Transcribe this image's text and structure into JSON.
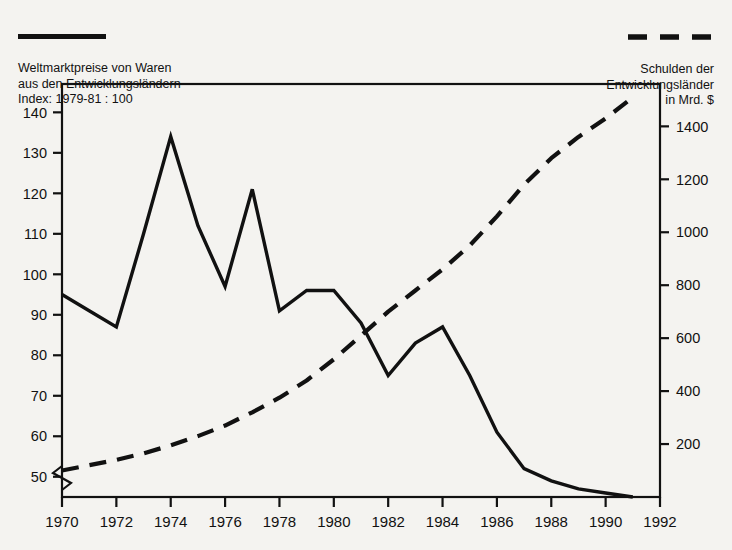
{
  "legend": {
    "left": {
      "swatch": "solid-line-swatch",
      "lines": [
        "Weltmarktpreise von Waren",
        "aus den Entwicklungsländern",
        "Index: 1979-81 : 100"
      ],
      "text": "Weltmarktpreise von Waren\naus den Entwicklungsländern\nIndex: 1979-81 : 100"
    },
    "right": {
      "swatch": "dashed-line-swatch",
      "lines": [
        "Schulden der",
        "Entwicklungsländer",
        "in Mrd. $"
      ],
      "text": "Schulden der\nEntwicklungsländer\nin Mrd. $"
    }
  },
  "colors": {
    "ink": "#111111",
    "background": "#f4f3f0"
  },
  "chart_data": {
    "type": "line",
    "title": "",
    "xlabel": "",
    "ylabel": "",
    "grid": false,
    "legend_position": "top",
    "x": [
      1970,
      1971,
      1972,
      1973,
      1974,
      1975,
      1976,
      1977,
      1978,
      1979,
      1980,
      1981,
      1982,
      1983,
      1984,
      1985,
      1986,
      1987,
      1988,
      1989,
      1990,
      1991
    ],
    "x_ticks": [
      1970,
      1972,
      1974,
      1976,
      1978,
      1980,
      1982,
      1984,
      1986,
      1988,
      1990,
      1992
    ],
    "xlim": [
      1970,
      1992
    ],
    "axis_break_left": true,
    "series": [
      {
        "name": "Weltmarktpreise von Waren aus den Entwicklungsländern",
        "unit": "Index: 1979-81 : 100",
        "axis": "left",
        "style": "solid",
        "color": "#111111",
        "values": [
          95,
          91,
          87,
          110,
          134,
          112,
          97,
          121,
          91,
          96,
          96,
          88,
          75,
          83,
          87,
          75,
          61,
          52,
          49,
          47,
          46,
          45
        ]
      },
      {
        "name": "Schulden der Entwicklungsländer",
        "unit": "Mrd. $",
        "axis": "right",
        "style": "dashed",
        "color": "#111111",
        "values": [
          100,
          120,
          140,
          165,
          195,
          230,
          270,
          320,
          375,
          440,
          520,
          610,
          700,
          780,
          860,
          950,
          1060,
          1180,
          1280,
          1360,
          1430,
          1510
        ]
      }
    ],
    "left_axis": {
      "ticks": [
        50,
        60,
        70,
        80,
        90,
        100,
        110,
        120,
        130,
        140
      ],
      "ylim": [
        45,
        147
      ],
      "label": "Index: 1979-81 : 100"
    },
    "right_axis": {
      "ticks": [
        200,
        400,
        600,
        800,
        1000,
        1200,
        1400
      ],
      "ylim": [
        0,
        1560
      ],
      "label": "Mrd. $"
    }
  }
}
